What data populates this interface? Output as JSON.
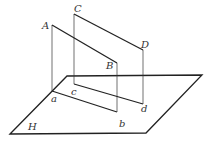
{
  "diagram": {
    "title": "",
    "plane": {
      "label": "H",
      "vertices": [
        [
          10,
          134
        ],
        [
          67,
          76
        ],
        [
          202,
          75
        ],
        [
          146,
          133
        ]
      ]
    },
    "points": {
      "A": {
        "label": "A",
        "x": 52,
        "y": 25
      },
      "B": {
        "label": "B",
        "x": 117,
        "y": 63
      },
      "C": {
        "label": "C",
        "x": 74,
        "y": 14
      },
      "D": {
        "label": "D",
        "x": 143,
        "y": 50
      },
      "a": {
        "label": "a",
        "x": 52,
        "y": 91
      },
      "b": {
        "label": "b",
        "x": 117,
        "y": 112
      },
      "c": {
        "label": "c",
        "x": 74,
        "y": 84
      },
      "d": {
        "label": "d",
        "x": 143,
        "y": 104
      }
    },
    "segments": [
      {
        "from": "A",
        "to": "B",
        "style": "thick"
      },
      {
        "from": "C",
        "to": "D",
        "style": "thick"
      },
      {
        "from": "a",
        "to": "b",
        "style": "thick"
      },
      {
        "from": "c",
        "to": "d",
        "style": "thick"
      },
      {
        "from": "A",
        "to": "a",
        "style": "thin"
      },
      {
        "from": "B",
        "to": "b",
        "style": "thin"
      },
      {
        "from": "C",
        "to": "c",
        "style": "thin"
      },
      {
        "from": "D",
        "to": "d",
        "style": "thin"
      }
    ],
    "colors": {
      "line": "#222222",
      "label": "#333333",
      "background": "#ffffff"
    }
  }
}
